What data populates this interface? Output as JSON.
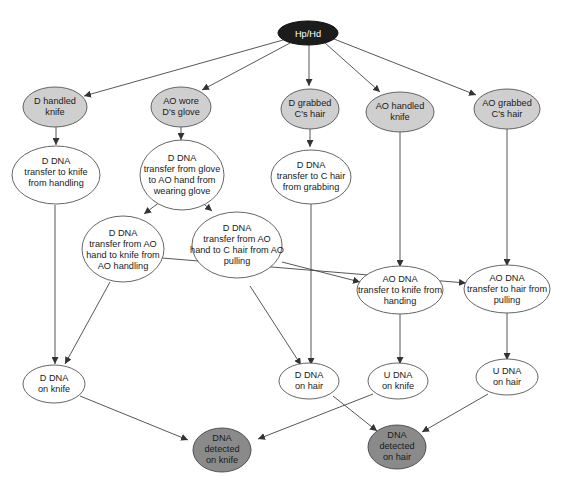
{
  "diagram": {
    "type": "bayesian-network",
    "colors": {
      "root_fill": "#1c1c1c",
      "activity_fill": "#cfcfcf",
      "intermediate_fill": "#ffffff",
      "result_fill": "#8a8a8a",
      "stroke": "#444444"
    },
    "nodes": {
      "root": {
        "lines": [
          "Hp/Hd"
        ]
      },
      "d_handled_knife": {
        "lines": [
          "D handled",
          "knife"
        ]
      },
      "ao_wore_glove": {
        "lines": [
          "AO wore",
          "D's glove"
        ]
      },
      "d_grabbed_hair": {
        "lines": [
          "D grabbed",
          "C's hair"
        ]
      },
      "ao_handled_knife": {
        "lines": [
          "AO handled",
          "knife"
        ]
      },
      "ao_grabbed_hair": {
        "lines": [
          "AO grabbed",
          "C's hair"
        ]
      },
      "d_transfer_knife": {
        "lines": [
          "D DNA",
          "transfer to knife",
          "from handling"
        ]
      },
      "d_transfer_glove": {
        "lines": [
          "D DNA",
          "transfer from glove",
          "to AO hand from",
          "wearing glove"
        ]
      },
      "d_transfer_hair": {
        "lines": [
          "D DNA",
          "transfer to C hair",
          "from grabbing"
        ]
      },
      "d_transfer_ao_knife": {
        "lines": [
          "D DNA",
          "transfer from AO",
          "hand to knife from",
          "AO handling"
        ]
      },
      "d_transfer_ao_hair": {
        "lines": [
          "D DNA",
          "transfer from AO",
          "hand to C hair from AO",
          "pulling"
        ]
      },
      "ao_transfer_knife": {
        "lines": [
          "AO DNA",
          "transfer to knife from",
          "handing"
        ]
      },
      "ao_transfer_hair": {
        "lines": [
          "AO DNA",
          "transfer to hair from",
          "pulling"
        ]
      },
      "d_dna_knife": {
        "lines": [
          "D DNA",
          "on knife"
        ]
      },
      "d_dna_hair": {
        "lines": [
          "D DNA",
          "on hair"
        ]
      },
      "u_dna_knife": {
        "lines": [
          "U DNA",
          "on knife"
        ]
      },
      "u_dna_hair": {
        "lines": [
          "U DNA",
          "on hair"
        ]
      },
      "detected_knife": {
        "lines": [
          "DNA",
          "detected",
          "on knife"
        ]
      },
      "detected_hair": {
        "lines": [
          "DNA",
          "detected",
          "on hair"
        ]
      }
    },
    "edges": [
      [
        "root",
        "d_handled_knife"
      ],
      [
        "root",
        "ao_wore_glove"
      ],
      [
        "root",
        "d_grabbed_hair"
      ],
      [
        "root",
        "ao_handled_knife"
      ],
      [
        "root",
        "ao_grabbed_hair"
      ],
      [
        "d_handled_knife",
        "d_transfer_knife"
      ],
      [
        "ao_wore_glove",
        "d_transfer_glove"
      ],
      [
        "d_grabbed_hair",
        "d_transfer_hair"
      ],
      [
        "d_transfer_glove",
        "d_transfer_ao_knife"
      ],
      [
        "d_transfer_glove",
        "d_transfer_ao_hair"
      ],
      [
        "ao_handled_knife",
        "ao_transfer_knife"
      ],
      [
        "ao_grabbed_hair",
        "ao_transfer_hair"
      ],
      [
        "d_transfer_ao_knife",
        "ao_transfer_knife"
      ],
      [
        "d_transfer_ao_hair",
        "ao_transfer_hair"
      ],
      [
        "d_transfer_knife",
        "d_dna_knife"
      ],
      [
        "d_transfer_ao_knife",
        "d_dna_knife"
      ],
      [
        "d_transfer_hair",
        "d_dna_hair"
      ],
      [
        "d_transfer_ao_hair",
        "d_dna_hair"
      ],
      [
        "ao_transfer_knife",
        "u_dna_knife"
      ],
      [
        "ao_transfer_hair",
        "u_dna_hair"
      ],
      [
        "d_dna_knife",
        "detected_knife"
      ],
      [
        "u_dna_knife",
        "detected_knife"
      ],
      [
        "d_dna_hair",
        "detected_hair"
      ],
      [
        "u_dna_hair",
        "detected_hair"
      ]
    ]
  }
}
